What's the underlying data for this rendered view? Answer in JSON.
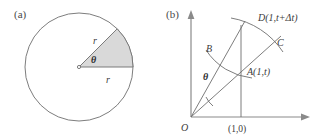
{
  "figure": {
    "panel_a": {
      "tag": "(a)",
      "radius_label_upper": "r",
      "radius_label_lower": "r",
      "angle_label": "θ",
      "shape": "circle-with-shaded-sector",
      "colors": {
        "sector_fill": "#d9d9d9",
        "stroke": "#6e6e6e"
      }
    },
    "panel_b": {
      "tag": "(b)",
      "origin_label": "O",
      "x_tick_label": "(1,0)",
      "angle_label": "θ",
      "points": [
        {
          "name": "point-D",
          "label": "D(1,t+Δt)"
        },
        {
          "name": "point-C",
          "label": "C"
        },
        {
          "name": "point-B",
          "label": "B"
        },
        {
          "name": "point-A",
          "label": "A(1,t)"
        }
      ],
      "colors": {
        "axis": "#8a8a8a",
        "stroke": "#6e6e6e"
      }
    }
  }
}
